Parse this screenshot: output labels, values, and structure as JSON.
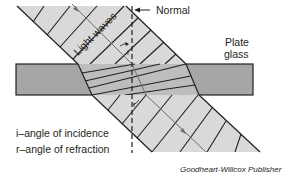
{
  "diagram": {
    "labels": {
      "normal": "Normal",
      "plate_glass_line1": "Plate",
      "plate_glass_line2": "glass",
      "light_waves": "Light waves",
      "angle_i": "i",
      "angle_r": "r"
    },
    "legend": [
      {
        "text": "i–angle of incidence"
      },
      {
        "text": "r–angle of refraction"
      }
    ],
    "credit": "Goodheart-Willcox Publisher",
    "colors": {
      "beam_fill": "#d9d9d9",
      "glass_fill": "#a6a6a6",
      "glass_beam_fill": "#bdbdbd",
      "line": "#231f20",
      "ray": "#6d6e71"
    }
  }
}
